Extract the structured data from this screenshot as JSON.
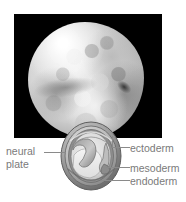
{
  "figure": {
    "background_color": "#ffffff",
    "label_color": "#7a7a7a",
    "leader_color": "#8a8a8a"
  },
  "photo": {
    "name": "embryo-photograph",
    "background_color": "#000000",
    "subject": "embryo-sphere"
  },
  "diagram": {
    "name": "embryo-cross-section"
  },
  "labels": {
    "neural_plate_line1": "neural",
    "neural_plate_line2": "plate",
    "ectoderm": "ectoderm",
    "mesoderm": "mesoderm",
    "endoderm": "endoderm"
  }
}
